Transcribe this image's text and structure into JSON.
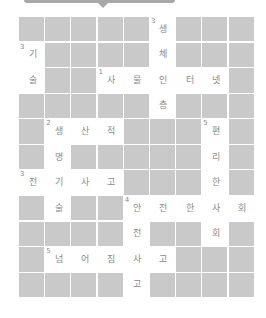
{
  "puzzle": {
    "type": "crossword",
    "cols": 9,
    "rows": 11,
    "colors": {
      "block": "#c9c9c9",
      "open": "#ffffff",
      "text": "#8a8a8a",
      "banner": "#a8a8a8"
    },
    "grid": [
      [
        null,
        null,
        null,
        null,
        null,
        {
          "ch": "생",
          "num": "3"
        },
        null,
        null,
        null
      ],
      [
        {
          "ch": "기",
          "num": "3"
        },
        null,
        null,
        null,
        null,
        {
          "ch": "체"
        },
        null,
        null,
        null
      ],
      [
        {
          "ch": "술"
        },
        null,
        null,
        {
          "ch": "사",
          "num": "1"
        },
        {
          "ch": "물"
        },
        {
          "ch": "인"
        },
        {
          "ch": "터"
        },
        {
          "ch": "넷"
        },
        null
      ],
      [
        null,
        null,
        null,
        null,
        null,
        {
          "ch": "층"
        },
        null,
        null,
        null
      ],
      [
        null,
        {
          "ch": "생",
          "num": "2"
        },
        {
          "ch": "산"
        },
        {
          "ch": "적"
        },
        null,
        null,
        null,
        {
          "ch": "편",
          "num": "5"
        },
        null
      ],
      [
        null,
        {
          "ch": "명"
        },
        null,
        null,
        null,
        null,
        null,
        {
          "ch": "리"
        },
        null
      ],
      [
        {
          "ch": "전",
          "num": "3"
        },
        {
          "ch": "기"
        },
        {
          "ch": "사"
        },
        {
          "ch": "고"
        },
        null,
        null,
        null,
        {
          "ch": "한"
        },
        null
      ],
      [
        null,
        {
          "ch": "술"
        },
        null,
        null,
        {
          "ch": "안",
          "num": "4"
        },
        {
          "ch": "전"
        },
        {
          "ch": "한"
        },
        {
          "ch": "사"
        },
        {
          "ch": "회"
        }
      ],
      [
        null,
        null,
        null,
        null,
        {
          "ch": "전"
        },
        null,
        null,
        {
          "ch": "회"
        },
        null
      ],
      [
        null,
        {
          "ch": "넘",
          "num": "5"
        },
        {
          "ch": "어"
        },
        {
          "ch": "짐"
        },
        {
          "ch": "사"
        },
        {
          "ch": "고"
        },
        null,
        null,
        null
      ],
      [
        null,
        null,
        null,
        null,
        {
          "ch": "고"
        },
        null,
        null,
        null,
        null
      ]
    ]
  }
}
